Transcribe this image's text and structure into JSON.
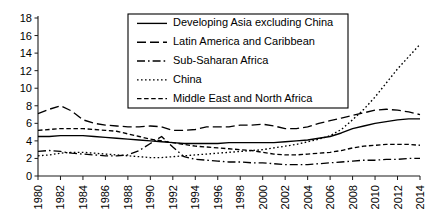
{
  "chart_data": {
    "type": "line",
    "title": "",
    "subtitle": "",
    "xlabel": "",
    "ylabel": "",
    "xlim": [
      1980,
      2014
    ],
    "ylim": [
      0,
      18
    ],
    "grid": false,
    "legend_position": "top-center",
    "y_ticks": [
      "0",
      "2",
      "4",
      "6",
      "8",
      "10",
      "12",
      "14",
      "16",
      "18"
    ],
    "x_ticks": [
      "1980",
      "1982",
      "1984",
      "1986",
      "1988",
      "1990",
      "1992",
      "1994",
      "1996",
      "1998",
      "2000",
      "2002",
      "2004",
      "2006",
      "2008",
      "2010",
      "2012",
      "2014"
    ],
    "x": [
      1980,
      1981,
      1982,
      1983,
      1984,
      1985,
      1986,
      1987,
      1988,
      1989,
      1990,
      1991,
      1992,
      1993,
      1994,
      1995,
      1996,
      1997,
      1998,
      1999,
      2000,
      2001,
      2002,
      2003,
      2004,
      2005,
      2006,
      2007,
      2008,
      2009,
      2010,
      2011,
      2012,
      2013,
      2014
    ],
    "series": [
      {
        "name": "Developing Asia excluding China",
        "dash_style": "solid",
        "color": "#000000",
        "values": [
          4.5,
          4.5,
          4.6,
          4.6,
          4.6,
          4.5,
          4.4,
          4.3,
          4.2,
          4.1,
          4.0,
          3.9,
          3.8,
          3.7,
          3.7,
          3.7,
          3.7,
          3.8,
          3.8,
          3.8,
          3.8,
          3.8,
          3.9,
          4.0,
          4.1,
          4.3,
          4.5,
          4.9,
          5.4,
          5.7,
          6.0,
          6.2,
          6.4,
          6.5,
          6.5
        ]
      },
      {
        "name": "Latin America and Caribbean",
        "dash_style": "dashed",
        "color": "#000000",
        "values": [
          7.1,
          7.6,
          8.0,
          7.4,
          6.4,
          6.0,
          5.8,
          5.7,
          5.6,
          5.6,
          5.7,
          5.6,
          5.2,
          5.2,
          5.3,
          5.6,
          5.6,
          5.6,
          5.8,
          5.8,
          5.9,
          5.7,
          5.4,
          5.4,
          5.6,
          6.0,
          6.3,
          6.6,
          6.9,
          7.2,
          7.5,
          7.6,
          7.5,
          7.3,
          7.0
        ]
      },
      {
        "name": "Sub-Saharan Africa",
        "dash_style": "dashdot",
        "color": "#000000",
        "values": [
          2.8,
          2.9,
          2.8,
          2.6,
          2.5,
          2.4,
          2.3,
          2.3,
          2.4,
          2.9,
          3.7,
          4.5,
          3.3,
          2.2,
          1.9,
          1.8,
          1.7,
          1.6,
          1.6,
          1.5,
          1.5,
          1.4,
          1.3,
          1.3,
          1.3,
          1.4,
          1.5,
          1.6,
          1.7,
          1.8,
          1.8,
          1.9,
          1.9,
          2.0,
          2.0
        ]
      },
      {
        "name": "China",
        "dash_style": "dotted",
        "color": "#000000",
        "values": [
          2.3,
          2.4,
          2.6,
          2.7,
          2.7,
          2.6,
          2.5,
          2.4,
          2.3,
          2.2,
          2.1,
          2.1,
          2.2,
          2.3,
          2.4,
          2.5,
          2.6,
          2.7,
          2.8,
          2.9,
          3.0,
          3.2,
          3.4,
          3.6,
          3.9,
          4.2,
          4.6,
          5.3,
          6.4,
          7.6,
          9.0,
          10.6,
          12.2,
          13.6,
          15.0
        ]
      },
      {
        "name": "Middle East and North Africa",
        "dash_style": "smalldash",
        "color": "#000000",
        "values": [
          5.2,
          5.3,
          5.4,
          5.4,
          5.4,
          5.3,
          5.2,
          5.1,
          4.8,
          4.5,
          4.2,
          4.0,
          3.8,
          3.6,
          3.4,
          3.3,
          3.2,
          3.1,
          3.0,
          2.9,
          2.7,
          2.5,
          2.4,
          2.4,
          2.5,
          2.6,
          2.7,
          2.9,
          3.2,
          3.4,
          3.5,
          3.6,
          3.6,
          3.6,
          3.5
        ]
      }
    ]
  }
}
